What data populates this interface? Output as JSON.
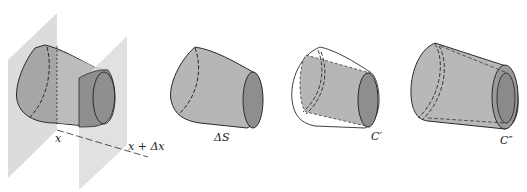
{
  "figure": {
    "panels": [
      {
        "id": "slab",
        "description": "Surface section between planes at x and x + Δx",
        "labels": [
          "x",
          "x + Δx"
        ]
      },
      {
        "id": "delta-s",
        "description": "Surface piece ΔS",
        "labels": [
          "ΔS"
        ]
      },
      {
        "id": "c-prime",
        "description": "Inner cylinder C′ inside outline of surface",
        "labels": [
          "C′"
        ]
      },
      {
        "id": "c-double-prime",
        "description": "Outer cylinder C″ (hollow tube)",
        "labels": [
          "C″"
        ]
      }
    ],
    "labels": {
      "x": "x",
      "x_dx": "x + Δx",
      "delta_s": "ΔS",
      "c_prime": "C′",
      "c_double_prime": "C″"
    },
    "colors": {
      "plane": "#dcdcdc",
      "body": "#b8b8b8",
      "body_dark": "#9a9a9a",
      "end_cap": "#8e8e8e",
      "outline": "#2a2a2a"
    }
  }
}
